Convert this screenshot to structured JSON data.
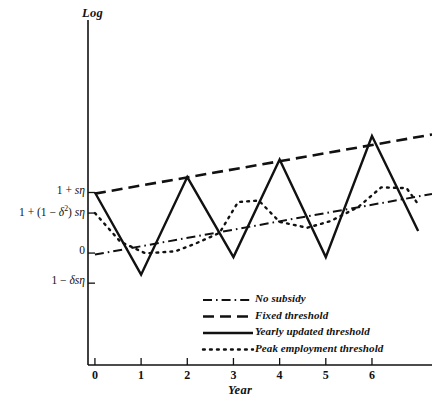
{
  "chart_data": {
    "type": "line",
    "title": "",
    "xlabel": "Year",
    "ylabel": "Log",
    "xlim": [
      -0.15,
      7.3
    ],
    "ylim": [
      -1.35,
      3.35
    ],
    "grid": false,
    "legend_position": "bottom-right",
    "xticks": [
      0,
      1,
      2,
      3,
      4,
      5,
      6
    ],
    "xticklabels": [
      "0",
      "1",
      "2",
      "3",
      "4",
      "5",
      "6"
    ],
    "yticks": [
      1.0,
      0.72,
      0.175,
      -0.235
    ],
    "yticklabels": [
      "1 + sη",
      "1 + (1 − δ²) sη",
      "0",
      "1 − δsη"
    ],
    "yticklabels_html": [
      "1 + <i>sη</i>",
      "1 + (1 − <i>δ</i><sup>2</sup>) <i>sη</i>",
      "0",
      "1 − <i>δsη</i>"
    ],
    "series": [
      {
        "name": "No subsidy",
        "style": "dashdot",
        "x": [
          0,
          7.3
        ],
        "y": [
          0.155,
          0.98
        ]
      },
      {
        "name": "Fixed threshold",
        "style": "dashed",
        "x": [
          0,
          7.3
        ],
        "y": [
          0.985,
          1.79
        ]
      },
      {
        "name": "Yearly updated threshold",
        "style": "solid",
        "x": [
          0,
          1,
          2,
          3,
          4,
          5,
          6,
          7
        ],
        "y": [
          1.0,
          -0.12,
          1.21,
          0.12,
          1.45,
          0.12,
          1.77,
          0.475
        ]
      },
      {
        "name": "Peak employment threshold",
        "style": "dotted",
        "x": [
          0,
          0.55,
          1.1,
          1.75,
          2.2,
          2.7,
          3.1,
          3.55,
          4.0,
          4.6,
          5.1,
          5.7,
          6.2,
          6.75,
          7.0
        ],
        "y": [
          0.72,
          0.33,
          0.17,
          0.2,
          0.31,
          0.45,
          0.87,
          0.89,
          0.6,
          0.52,
          0.61,
          0.8,
          1.07,
          1.06,
          0.84
        ]
      }
    ],
    "legend": [
      {
        "label": "No subsidy",
        "style": "dashdot"
      },
      {
        "label": "Fixed threshold",
        "style": "dashed"
      },
      {
        "label": "Yearly updated threshold",
        "style": "solid"
      },
      {
        "label": "Peak employment threshold",
        "style": "dotted"
      }
    ]
  }
}
